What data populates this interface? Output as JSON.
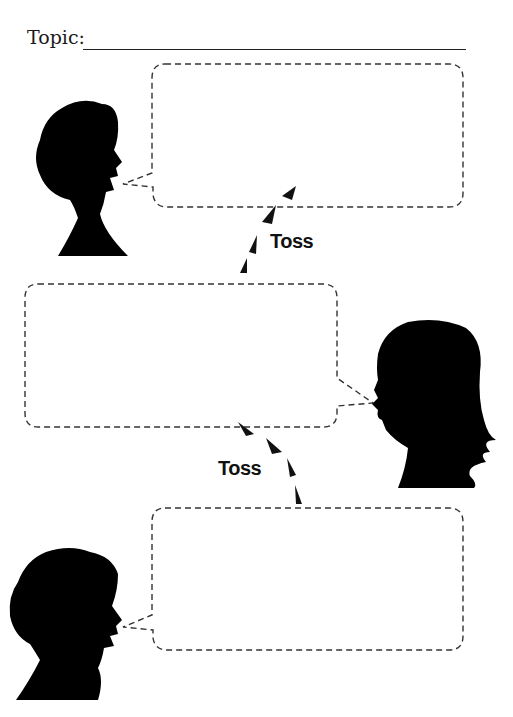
{
  "worksheet": {
    "top_cut_text": "Copy",
    "topic_label": "Topic:",
    "topic_value": "",
    "toss_labels": [
      "Toss",
      "Toss"
    ],
    "speech_bubbles": [
      {
        "speaker": "person-1",
        "text": ""
      },
      {
        "speaker": "person-2",
        "text": ""
      },
      {
        "speaker": "person-1",
        "text": ""
      }
    ]
  }
}
